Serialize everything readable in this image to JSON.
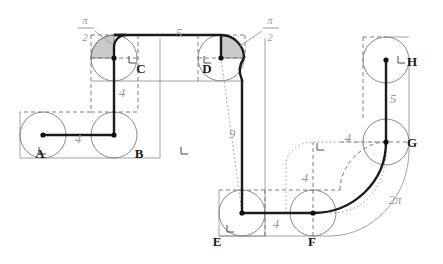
{
  "figure": {
    "type": "geometry-diagram",
    "background_color": "#ffffff",
    "path_color": "#1a1a1a",
    "construction_color": "#8c8c8c",
    "dimension_text_color": "#9a9a9a",
    "sector_fill_color": "#9aa0a6"
  },
  "vertices": [
    {
      "id": "A",
      "label": "A",
      "x": 43,
      "y": 135,
      "label_x": 40,
      "label_y": 158,
      "circle_r": 23
    },
    {
      "id": "B",
      "label": "B",
      "x": 114,
      "y": 135,
      "label_x": 139,
      "label_y": 158,
      "circle_r": 23
    },
    {
      "id": "C",
      "label": "C",
      "x": 114,
      "y": 58,
      "label_x": 141,
      "label_y": 73,
      "circle_r": 23
    },
    {
      "id": "D",
      "label": "D",
      "x": 221,
      "y": 58,
      "label_x": 207,
      "label_y": 73,
      "circle_r": 23
    },
    {
      "id": "E",
      "label": "E",
      "x": 242,
      "y": 213,
      "label_x": 217,
      "label_y": 246,
      "circle_r": 23
    },
    {
      "id": "F",
      "label": "F",
      "x": 313,
      "y": 213,
      "label_x": 312,
      "label_y": 246,
      "circle_r": 23
    },
    {
      "id": "G",
      "label": "G",
      "x": 386,
      "y": 142,
      "label_x": 412,
      "label_y": 147,
      "circle_r": 23
    },
    {
      "id": "H",
      "label": "H",
      "x": 386,
      "y": 60,
      "label_x": 412,
      "label_y": 66,
      "circle_r": 23
    }
  ],
  "dimensions": [
    {
      "id": "dim-ab",
      "value": "4",
      "x": 78,
      "y": 143,
      "kind": "length"
    },
    {
      "id": "dim-bc",
      "value": "4",
      "x": 122,
      "y": 97,
      "kind": "length"
    },
    {
      "id": "dim-cd",
      "value": "5",
      "x": 179,
      "y": 37,
      "kind": "length"
    },
    {
      "id": "dim-de",
      "value": "9",
      "x": 232,
      "y": 138,
      "kind": "length"
    },
    {
      "id": "dim-ef",
      "value": "4",
      "x": 276,
      "y": 228,
      "kind": "length"
    },
    {
      "id": "dim-fg",
      "value": "4",
      "x": 305,
      "y": 182,
      "kind": "length"
    },
    {
      "id": "dim-gh-offset",
      "value": "4",
      "x": 348,
      "y": 142,
      "kind": "length"
    },
    {
      "id": "dim-gh",
      "value": "5",
      "x": 393,
      "y": 103,
      "kind": "length"
    },
    {
      "id": "arc-fg",
      "value": "2π",
      "x": 395,
      "y": 204,
      "kind": "arc-length"
    }
  ],
  "angle_annotations": [
    {
      "id": "angle-at-c",
      "numerator": "π",
      "denominator": "2",
      "num_x": 85,
      "num_y": 24,
      "bar_x1": 78,
      "bar_x2": 94,
      "bar_y": 28,
      "den_x": 85,
      "den_y": 41,
      "leader_x1": 95,
      "leader_y1": 31,
      "leader_x2": 113,
      "leader_y2": 45
    },
    {
      "id": "angle-at-d",
      "numerator": "π",
      "denominator": "2",
      "num_x": 270,
      "num_y": 24,
      "bar_x1": 263,
      "bar_x2": 279,
      "bar_y": 28,
      "den_x": 270,
      "den_y": 41,
      "leader_x1": 262,
      "leader_y1": 31,
      "leader_x2": 240,
      "leader_y2": 46
    }
  ],
  "right_angle_marks": [
    {
      "id": "ra-a",
      "x": 39,
      "y": 147
    },
    {
      "id": "ra-b",
      "x": 181,
      "y": 147
    },
    {
      "id": "ra-c",
      "x": 129,
      "y": 56
    },
    {
      "id": "ra-d",
      "x": 204,
      "y": 56
    },
    {
      "id": "ra-e",
      "x": 227,
      "y": 225
    },
    {
      "id": "ra-f",
      "x": 317,
      "y": 143
    },
    {
      "id": "ra-h",
      "x": 398,
      "y": 56
    }
  ]
}
